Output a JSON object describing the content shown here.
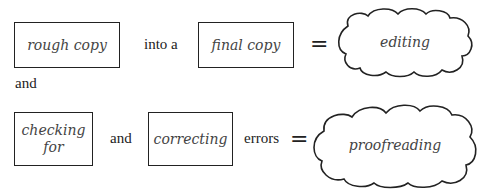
{
  "row1": {
    "box1": "rough copy",
    "connector": "into a",
    "box2": "final copy",
    "equals": "=",
    "result": "editing"
  },
  "between": "and",
  "row2": {
    "box1": "checking for",
    "connector1": "and",
    "box2": "correcting",
    "connector2": "errors",
    "equals": "=",
    "result": "proofreading"
  }
}
